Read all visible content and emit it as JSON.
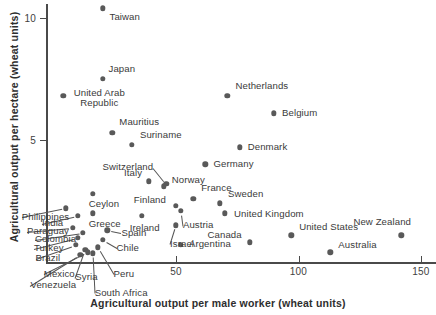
{
  "chart_data": {
    "type": "scatter",
    "title": "",
    "xlabel": "Agricultural output per male worker (wheat units)",
    "ylabel": "Agricultural output per hectare (wheat units)",
    "xlim": [
      0,
      158
    ],
    "ylim": [
      0,
      10.6
    ],
    "xticks": [
      50,
      100,
      150
    ],
    "yticks": [
      5,
      10
    ],
    "xticklabels": [
      "50",
      "100",
      "150"
    ],
    "yticklabels": [
      "5",
      "10"
    ],
    "grid": false,
    "legend": "none",
    "marker": "filled-circle",
    "marker_color": "#595959",
    "points": [
      {
        "label": "Taiwan",
        "x": 20,
        "y": 10.4
      },
      {
        "label": "Japan",
        "x": 20,
        "y": 7.5
      },
      {
        "label": "United Arab Republic",
        "x": 4,
        "y": 6.8
      },
      {
        "label": "Netherlands",
        "x": 71,
        "y": 6.8
      },
      {
        "label": "Belgium",
        "x": 90,
        "y": 6.1
      },
      {
        "label": "Mauritius",
        "x": 24,
        "y": 5.3
      },
      {
        "label": "Suriname",
        "x": 32,
        "y": 4.8
      },
      {
        "label": "Denmark",
        "x": 76,
        "y": 4.7
      },
      {
        "label": "Germany",
        "x": 62,
        "y": 4.0
      },
      {
        "label": "Switzerland",
        "x": 46,
        "y": 3.2
      },
      {
        "label": "Italy",
        "x": 39,
        "y": 3.3
      },
      {
        "label": "Norway",
        "x": 45,
        "y": 3.1
      },
      {
        "label": "Ceylon",
        "x": 16,
        "y": 2.8
      },
      {
        "label": "Philippines",
        "x": 5,
        "y": 2.2
      },
      {
        "label": "France",
        "x": 57,
        "y": 2.6
      },
      {
        "label": "Sweden",
        "x": 68,
        "y": 2.4
      },
      {
        "label": "Finland",
        "x": 50,
        "y": 2.3
      },
      {
        "label": "Austria",
        "x": 52,
        "y": 2.1
      },
      {
        "label": "United Kingdom",
        "x": 70,
        "y": 2.0
      },
      {
        "label": "India",
        "x": 10,
        "y": 1.9
      },
      {
        "label": "Greece",
        "x": 16,
        "y": 2.0
      },
      {
        "label": "Ireland",
        "x": 36,
        "y": 1.9
      },
      {
        "label": "Israel",
        "x": 50,
        "y": 1.5
      },
      {
        "label": "Paraguay",
        "x": 8,
        "y": 1.4
      },
      {
        "label": "Colombia",
        "x": 12,
        "y": 1.2
      },
      {
        "label": "Spain",
        "x": 22,
        "y": 1.3
      },
      {
        "label": "Turkey",
        "x": 10,
        "y": 1.0
      },
      {
        "label": "Chile",
        "x": 20,
        "y": 0.9
      },
      {
        "label": "Brazil",
        "x": 9,
        "y": 0.7
      },
      {
        "label": "Syria",
        "x": 13,
        "y": 0.5
      },
      {
        "label": "Mexico",
        "x": 14,
        "y": 0.4
      },
      {
        "label": "Peru",
        "x": 18,
        "y": 0.6
      },
      {
        "label": "South Africa",
        "x": 16,
        "y": 0.35
      },
      {
        "label": "Venezuela",
        "x": 11,
        "y": 0.3
      },
      {
        "label": "Argentina",
        "x": 52,
        "y": 0.7
      },
      {
        "label": "Canada",
        "x": 80,
        "y": 0.8
      },
      {
        "label": "United States",
        "x": 97,
        "y": 1.1
      },
      {
        "label": "Australia",
        "x": 113,
        "y": 0.4
      },
      {
        "label": "New Zealand",
        "x": 142,
        "y": 1.1
      }
    ]
  },
  "plot": {
    "x_axis_label": "Agricultural output per male worker (wheat units)",
    "y_axis_label": "Agricultural output per hectare (wheat units)"
  }
}
